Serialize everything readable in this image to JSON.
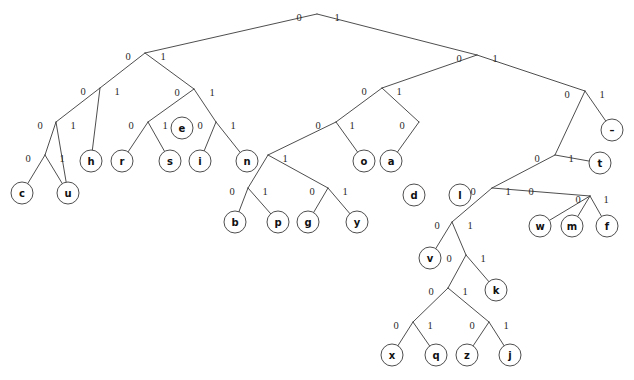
{
  "figure": {
    "caption_fragment": "",
    "background_color": "#ffffff",
    "line_color": "#3a3a3a",
    "text_color": "#111111",
    "node_radius": 11
  },
  "chart_data": {
    "type": "diagram",
    "diagram_kind": "binary-tree",
    "bit_labels": [
      "0",
      "1"
    ],
    "edge_label_left": "0",
    "edge_label_right": "1",
    "leaf_symbols": [
      "c",
      "u",
      "h",
      "r",
      "s",
      "e",
      "i",
      "n",
      "b",
      "p",
      "g",
      "y",
      "o",
      "a",
      "d",
      "x",
      "q",
      "z",
      "j",
      "v",
      "k",
      "w",
      "m",
      "f",
      "t",
      "–"
    ],
    "leaf_count": 26,
    "nodes": [
      {
        "id": "root",
        "x": 317,
        "y": 14,
        "type": "internal",
        "label": ""
      },
      {
        "id": "n-L",
        "x": 145,
        "y": 53,
        "type": "internal",
        "label": ""
      },
      {
        "id": "n-R",
        "x": 477,
        "y": 55,
        "type": "internal",
        "label": ""
      },
      {
        "id": "n-LL",
        "x": 100,
        "y": 88,
        "type": "internal",
        "label": ""
      },
      {
        "id": "n-LR",
        "x": 194,
        "y": 89,
        "type": "internal",
        "label": ""
      },
      {
        "id": "n-RL",
        "x": 382,
        "y": 88,
        "type": "internal",
        "label": ""
      },
      {
        "id": "n-RR",
        "x": 585,
        "y": 91,
        "type": "internal",
        "label": ""
      },
      {
        "id": "n-LLL",
        "x": 56,
        "y": 122,
        "type": "internal",
        "label": ""
      },
      {
        "id": "n-LRL",
        "x": 148,
        "y": 122,
        "type": "internal",
        "label": ""
      },
      {
        "id": "n-LRR",
        "x": 216,
        "y": 122,
        "type": "internal",
        "label": ""
      },
      {
        "id": "n-RLL",
        "x": 336,
        "y": 122,
        "type": "internal",
        "label": ""
      },
      {
        "id": "n-RLR",
        "x": 419,
        "y": 122,
        "type": "internal",
        "label": ""
      },
      {
        "id": "n-RRL",
        "x": 555,
        "y": 155,
        "type": "internal",
        "label": ""
      },
      {
        "id": "n-LLLL",
        "x": 45,
        "y": 155,
        "type": "internal",
        "label": ""
      },
      {
        "id": "n-RLLL",
        "x": 268,
        "y": 155,
        "type": "internal",
        "label": ""
      },
      {
        "id": "n-RRLL",
        "x": 492,
        "y": 188,
        "type": "internal",
        "label": ""
      },
      {
        "id": "n-RLLLL",
        "x": 248,
        "y": 188,
        "type": "internal",
        "label": ""
      },
      {
        "id": "n-RLLLR",
        "x": 328,
        "y": 188,
        "type": "internal",
        "label": ""
      },
      {
        "id": "n-deep1",
        "x": 452,
        "y": 222,
        "type": "internal",
        "label": ""
      },
      {
        "id": "n-deep2",
        "x": 466,
        "y": 255,
        "type": "internal",
        "label": ""
      },
      {
        "id": "n-deep3",
        "x": 448,
        "y": 288,
        "type": "internal",
        "label": ""
      },
      {
        "id": "n-deep4",
        "x": 413,
        "y": 322,
        "type": "internal",
        "label": ""
      },
      {
        "id": "n-deep5",
        "x": 489,
        "y": 322,
        "type": "internal",
        "label": ""
      },
      {
        "id": "n-mf",
        "x": 590,
        "y": 196,
        "type": "internal",
        "label": ""
      },
      {
        "id": "leaf-c",
        "x": 22,
        "y": 193,
        "type": "leaf",
        "label": "c"
      },
      {
        "id": "leaf-u",
        "x": 68,
        "y": 193,
        "type": "leaf",
        "label": "u"
      },
      {
        "id": "leaf-h",
        "x": 91,
        "y": 161,
        "type": "leaf",
        "label": "h"
      },
      {
        "id": "leaf-r",
        "x": 122,
        "y": 161,
        "type": "leaf",
        "label": "r"
      },
      {
        "id": "leaf-s",
        "x": 170,
        "y": 161,
        "type": "leaf",
        "label": "s"
      },
      {
        "id": "leaf-e",
        "x": 182,
        "y": 128,
        "type": "leaf",
        "label": "e"
      },
      {
        "id": "leaf-i",
        "x": 200,
        "y": 161,
        "type": "leaf",
        "label": "i"
      },
      {
        "id": "leaf-n",
        "x": 247,
        "y": 161,
        "type": "leaf",
        "label": "n"
      },
      {
        "id": "leaf-b",
        "x": 235,
        "y": 222,
        "type": "leaf",
        "label": "b"
      },
      {
        "id": "leaf-p",
        "x": 278,
        "y": 222,
        "type": "leaf",
        "label": "p"
      },
      {
        "id": "leaf-g",
        "x": 308,
        "y": 222,
        "type": "leaf",
        "label": "g"
      },
      {
        "id": "leaf-y",
        "x": 357,
        "y": 222,
        "type": "leaf",
        "label": "y"
      },
      {
        "id": "leaf-o",
        "x": 364,
        "y": 161,
        "type": "leaf",
        "label": "o"
      },
      {
        "id": "leaf-a",
        "x": 391,
        "y": 161,
        "type": "leaf",
        "label": "a"
      },
      {
        "id": "leaf-d",
        "x": 414,
        "y": 195,
        "type": "leaf",
        "label": "d"
      },
      {
        "id": "leaf-l",
        "x": 460,
        "y": 195,
        "type": "leaf",
        "label": "l"
      },
      {
        "id": "leaf-v",
        "x": 430,
        "y": 258,
        "type": "leaf",
        "label": "v"
      },
      {
        "id": "leaf-k",
        "x": 496,
        "y": 290,
        "type": "leaf",
        "label": "k"
      },
      {
        "id": "leaf-x",
        "x": 392,
        "y": 355,
        "type": "leaf",
        "label": "x"
      },
      {
        "id": "leaf-q",
        "x": 436,
        "y": 355,
        "type": "leaf",
        "label": "q"
      },
      {
        "id": "leaf-z",
        "x": 467,
        "y": 355,
        "type": "leaf",
        "label": "z"
      },
      {
        "id": "leaf-j",
        "x": 510,
        "y": 355,
        "type": "leaf",
        "label": "j"
      },
      {
        "id": "leaf-w",
        "x": 540,
        "y": 226,
        "type": "leaf",
        "label": "w"
      },
      {
        "id": "leaf-m",
        "x": 572,
        "y": 226,
        "type": "leaf",
        "label": "m"
      },
      {
        "id": "leaf-f",
        "x": 607,
        "y": 226,
        "type": "leaf",
        "label": "f"
      },
      {
        "id": "leaf-t",
        "x": 600,
        "y": 163,
        "type": "leaf",
        "label": "t"
      },
      {
        "id": "leaf-dash",
        "x": 612,
        "y": 130,
        "type": "leaf",
        "label": "–"
      }
    ],
    "edges": [
      {
        "from": "root",
        "to": "n-L",
        "bit": "0",
        "bx": 299,
        "by": 17
      },
      {
        "from": "root",
        "to": "n-R",
        "bit": "1",
        "bx": 337,
        "by": 17
      },
      {
        "from": "n-L",
        "to": "n-LL",
        "bit": "0",
        "bx": 128,
        "by": 56
      },
      {
        "from": "n-L",
        "to": "n-LR",
        "bit": "1",
        "bx": 163,
        "by": 56
      },
      {
        "from": "n-R",
        "to": "n-RL",
        "bit": "0",
        "bx": 459,
        "by": 58
      },
      {
        "from": "n-R",
        "to": "n-RR",
        "bit": "1",
        "bx": 495,
        "by": 58
      },
      {
        "from": "n-LL",
        "to": "n-LLL",
        "bit": "0",
        "bx": 83,
        "by": 91
      },
      {
        "from": "n-LL",
        "to": "leaf-h",
        "bit": "1",
        "bx": 117,
        "by": 91
      },
      {
        "from": "n-LR",
        "to": "n-LRL",
        "bit": "0",
        "bx": 177,
        "by": 92
      },
      {
        "from": "n-LR",
        "to": "n-LRR",
        "bit": "1",
        "bx": 212,
        "by": 92
      },
      {
        "from": "n-RL",
        "to": "n-RLL",
        "bit": "0",
        "bx": 364,
        "by": 91
      },
      {
        "from": "n-RL",
        "to": "n-RLR",
        "bit": "1",
        "bx": 399,
        "by": 91
      },
      {
        "from": "n-RR",
        "to": "n-RRL",
        "bit": "0",
        "bx": 567,
        "by": 94
      },
      {
        "from": "n-RR",
        "to": "leaf-dash",
        "bit": "1",
        "bx": 602,
        "by": 94
      },
      {
        "from": "n-LLL",
        "to": "n-LLLL",
        "bit": "0",
        "bx": 40,
        "by": 125
      },
      {
        "from": "n-LLL",
        "to": "leaf-u",
        "bit": "1",
        "bx": 73,
        "by": 125
      },
      {
        "from": "n-LRL",
        "to": "leaf-r",
        "bit": "0",
        "bx": 131,
        "by": 125
      },
      {
        "from": "n-LRL",
        "to": "leaf-s",
        "bit": "1",
        "bx": 165,
        "by": 125
      },
      {
        "from": "n-LRR",
        "to": "leaf-i",
        "bit": "0",
        "bx": 200,
        "by": 125
      },
      {
        "from": "n-LRR",
        "to": "leaf-n",
        "bit": "1",
        "bx": 233,
        "by": 125
      },
      {
        "from": "n-LLLL",
        "to": "leaf-c",
        "bit": "0",
        "bx": 28,
        "by": 158
      },
      {
        "from": "n-LLLL",
        "to": "leaf-u",
        "bit": "1",
        "bx": 62,
        "by": 158
      },
      {
        "from": "n-RLL",
        "to": "n-RLLL",
        "bit": "0",
        "bx": 318,
        "by": 125
      },
      {
        "from": "n-RLL",
        "to": "leaf-o",
        "bit": "1",
        "bx": 352,
        "by": 125
      },
      {
        "from": "n-RLR",
        "to": "leaf-a",
        "bit": "0",
        "bx": 402,
        "by": 125
      },
      {
        "from": "n-RLR",
        "to": "n-RLRR",
        "bit": "1",
        "bx": 436,
        "by": 125
      },
      {
        "from": "n-RLLL",
        "to": "n-RLLLL",
        "bit": "0",
        "bx": 251,
        "by": 158
      },
      {
        "from": "n-RLLL",
        "to": "n-RLLLR",
        "bit": "1",
        "bx": 285,
        "by": 158
      },
      {
        "from": "n-RLLLL",
        "to": "leaf-b",
        "bit": "0",
        "bx": 232,
        "by": 191
      },
      {
        "from": "n-RLLLL",
        "to": "leaf-p",
        "bit": "1",
        "bx": 265,
        "by": 191
      },
      {
        "from": "n-RLLLR",
        "to": "leaf-g",
        "bit": "0",
        "bx": 312,
        "by": 191
      },
      {
        "from": "n-RLLLR",
        "to": "leaf-y",
        "bit": "1",
        "bx": 345,
        "by": 191
      },
      {
        "from": "n-RLRR",
        "to": "leaf-d",
        "bit": "0",
        "bx": 412,
        "by": 158
      },
      {
        "from": "n-RLRR",
        "to": "leaf-l",
        "bit": "1",
        "bx": 447,
        "by": 158
      },
      {
        "from": "n-RRL",
        "to": "n-RRLL",
        "bit": "0",
        "bx": 537,
        "by": 158
      },
      {
        "from": "n-RRL",
        "to": "leaf-t",
        "bit": "1",
        "bx": 571,
        "by": 158
      },
      {
        "from": "n-RRLL",
        "to": "n-deep1",
        "bit": "0",
        "bx": 473,
        "by": 191
      },
      {
        "from": "n-RRLL",
        "to": "n-mf",
        "bit": "1",
        "bx": 508,
        "by": 191
      },
      {
        "from": "n-deep1",
        "to": "leaf-v",
        "bit": "0",
        "bx": 437,
        "by": 225
      },
      {
        "from": "n-deep1",
        "to": "n-deep2",
        "bit": "1",
        "bx": 470,
        "by": 225
      },
      {
        "from": "n-deep2",
        "to": "n-deep3",
        "bit": "0",
        "bx": 449,
        "by": 258
      },
      {
        "from": "n-deep2",
        "to": "leaf-k",
        "bit": "1",
        "bx": 483,
        "by": 258
      },
      {
        "from": "n-deep3",
        "to": "n-deep4",
        "bit": "0",
        "bx": 431,
        "by": 291
      },
      {
        "from": "n-deep3",
        "to": "n-deep5",
        "bit": "1",
        "bx": 465,
        "by": 291
      },
      {
        "from": "n-deep4",
        "to": "leaf-x",
        "bit": "0",
        "bx": 396,
        "by": 325
      },
      {
        "from": "n-deep4",
        "to": "leaf-q",
        "bit": "1",
        "bx": 430,
        "by": 325
      },
      {
        "from": "n-deep5",
        "to": "leaf-z",
        "bit": "0",
        "bx": 472,
        "by": 325
      },
      {
        "from": "n-deep5",
        "to": "leaf-j",
        "bit": "1",
        "bx": 506,
        "by": 325
      },
      {
        "from": "n-mf",
        "to": "leaf-w",
        "bit": "0",
        "bx": 531,
        "by": 191
      },
      {
        "from": "n-mf",
        "to": "leaf-m",
        "bit": "0",
        "bx": 578,
        "by": 199
      },
      {
        "from": "n-mf",
        "to": "leaf-f",
        "bit": "1",
        "bx": 606,
        "by": 199
      }
    ]
  }
}
